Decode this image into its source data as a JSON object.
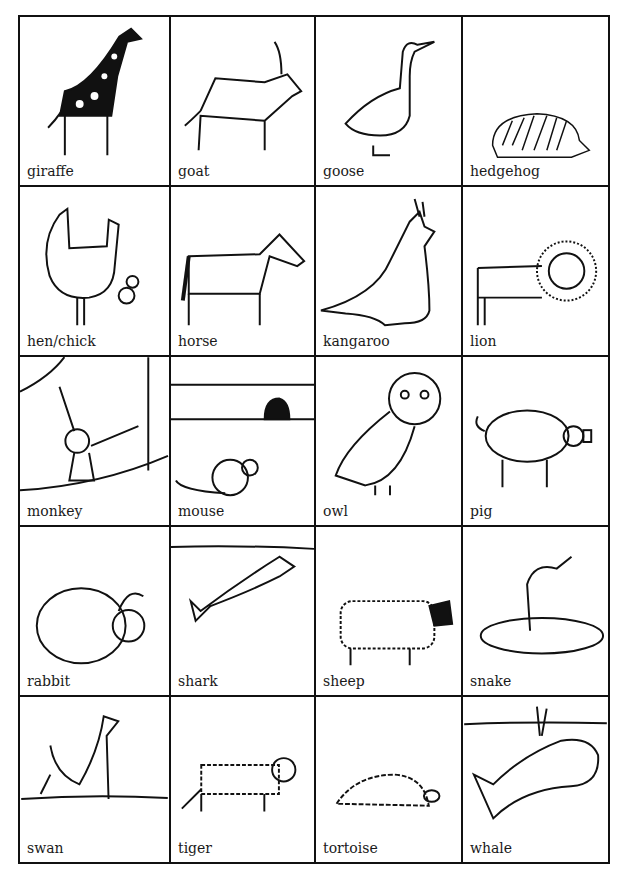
{
  "card_grid": {
    "rows": 5,
    "columns": 4,
    "cards": [
      {
        "label": "giraffe",
        "icon": "giraffe-icon"
      },
      {
        "label": "goat",
        "icon": "goat-icon"
      },
      {
        "label": "goose",
        "icon": "goose-icon"
      },
      {
        "label": "hedgehog",
        "icon": "hedgehog-icon"
      },
      {
        "label": "hen/chick",
        "icon": "hen-chick-icon"
      },
      {
        "label": "horse",
        "icon": "horse-icon"
      },
      {
        "label": "kangaroo",
        "icon": "kangaroo-icon"
      },
      {
        "label": "lion",
        "icon": "lion-icon"
      },
      {
        "label": "monkey",
        "icon": "monkey-icon"
      },
      {
        "label": "mouse",
        "icon": "mouse-icon"
      },
      {
        "label": "owl",
        "icon": "owl-icon"
      },
      {
        "label": "pig",
        "icon": "pig-icon"
      },
      {
        "label": "rabbit",
        "icon": "rabbit-icon"
      },
      {
        "label": "shark",
        "icon": "shark-icon"
      },
      {
        "label": "sheep",
        "icon": "sheep-icon"
      },
      {
        "label": "snake",
        "icon": "snake-icon"
      },
      {
        "label": "swan",
        "icon": "swan-icon"
      },
      {
        "label": "tiger",
        "icon": "tiger-icon"
      },
      {
        "label": "tortoise",
        "icon": "tortoise-icon"
      },
      {
        "label": "whale",
        "icon": "whale-icon"
      }
    ]
  }
}
